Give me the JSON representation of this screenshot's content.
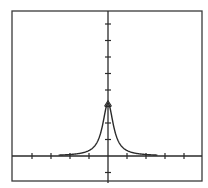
{
  "chart_data": {
    "type": "line",
    "title": "",
    "xlabel": "",
    "ylabel": "",
    "xlim": [
      -5,
      5
    ],
    "ylim": [
      -1.5,
      8.8
    ],
    "grid": false,
    "legend": null,
    "x_ticks": [
      -4,
      -3,
      -2,
      -1,
      1,
      2,
      3,
      4
    ],
    "y_ticks": [
      -1,
      1,
      2,
      3,
      4,
      5,
      6,
      7,
      8
    ],
    "tick_labels_shown": false,
    "series": [
      {
        "name": "lorentzian-peak",
        "description": "Symmetric sharp peak centered at x=0, approximately y = 3.2 / (1 + (x/0.34)^2)",
        "peak": {
          "x": 0,
          "y": 3.2
        },
        "x": [
          -2.6,
          -2,
          -1.5,
          -1,
          -0.75,
          -0.5,
          -0.4,
          -0.3,
          -0.2,
          -0.1,
          0,
          0.1,
          0.2,
          0.3,
          0.4,
          0.5,
          0.75,
          1,
          1.5,
          2,
          2.6
        ],
        "values": [
          0.05,
          0.09,
          0.16,
          0.33,
          0.55,
          1.0,
          1.33,
          1.79,
          2.38,
          2.94,
          3.2,
          2.94,
          2.38,
          1.79,
          1.33,
          1.0,
          0.55,
          0.33,
          0.16,
          0.09,
          0.05
        ]
      }
    ],
    "annotations": [
      "small triangle marker at peak (0, 3.2)"
    ]
  },
  "layout": {
    "px": {
      "frame": {
        "left": 12,
        "top": 11,
        "right": 202,
        "bottom": 181
      },
      "origin": {
        "x": 108,
        "y": 156
      },
      "x_unit": 19,
      "y_unit": 16.5
    }
  },
  "colors": {
    "background": "#ffffff",
    "ink": "#2a2a2a"
  }
}
